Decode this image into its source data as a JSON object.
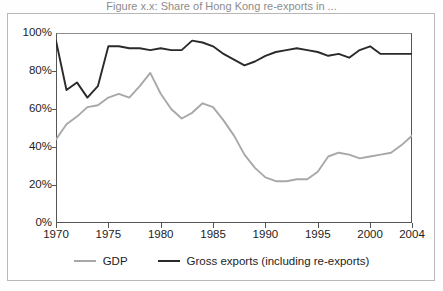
{
  "figure": {
    "title_partial": "Figure x.x: Share of Hong Kong re-exports in ...",
    "frame_color": "#b8b8b8",
    "background": "#ffffff"
  },
  "axes": {
    "y_ticks": [
      "0%",
      "20%",
      "40%",
      "60%",
      "80%",
      "100%"
    ],
    "x_ticks": [
      "1970",
      "1975",
      "1980",
      "1985",
      "1990",
      "1995",
      "2000",
      "2004"
    ]
  },
  "legend": {
    "items": [
      {
        "label": "GDP",
        "color": "#a8a8a8",
        "swatch": "line-swatch-gdp"
      },
      {
        "label": "Gross exports (including re-exports)",
        "color": "#2a2a2a",
        "swatch": "line-swatch-exports"
      }
    ]
  },
  "chart_data": {
    "type": "line",
    "title": "",
    "xlabel": "",
    "ylabel": "",
    "xlim": [
      1970,
      2004
    ],
    "ylim": [
      0,
      100
    ],
    "y_tick_values": [
      0,
      20,
      40,
      60,
      80,
      100
    ],
    "y_tick_labels": [
      "0%",
      "20%",
      "40%",
      "60%",
      "80%",
      "100%"
    ],
    "x_tick_values": [
      1970,
      1975,
      1980,
      1985,
      1990,
      1995,
      2000,
      2004
    ],
    "x_tick_labels": [
      "1970",
      "1975",
      "1980",
      "1985",
      "1990",
      "1995",
      "2000",
      "2004"
    ],
    "grid": false,
    "legend_position": "bottom",
    "x": [
      1970,
      1971,
      1972,
      1973,
      1974,
      1975,
      1976,
      1977,
      1978,
      1979,
      1980,
      1981,
      1982,
      1983,
      1984,
      1985,
      1986,
      1987,
      1988,
      1989,
      1990,
      1991,
      1992,
      1993,
      1994,
      1995,
      1996,
      1997,
      1998,
      1999,
      2000,
      2001,
      2002,
      2003,
      2004
    ],
    "series": [
      {
        "name": "GDP",
        "color": "#a8a8a8",
        "values": [
          44,
          52,
          56,
          61,
          62,
          66,
          68,
          66,
          72,
          79,
          68,
          60,
          55,
          58,
          63,
          61,
          54,
          46,
          36,
          29,
          24,
          22,
          22,
          23,
          23,
          27,
          35,
          37,
          36,
          34,
          35,
          36,
          37,
          41,
          46
        ]
      },
      {
        "name": "Gross exports (including re-exports)",
        "color": "#2a2a2a",
        "values": [
          96,
          70,
          74,
          66,
          72,
          93,
          93,
          92,
          92,
          91,
          92,
          91,
          91,
          96,
          95,
          93,
          89,
          86,
          83,
          85,
          88,
          90,
          91,
          92,
          91,
          90,
          88,
          89,
          87,
          91,
          93,
          89,
          89,
          89,
          89
        ]
      }
    ]
  }
}
